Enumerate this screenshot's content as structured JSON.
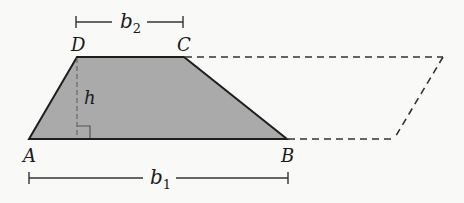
{
  "diagram": {
    "colors": {
      "fill": "#aaaaaa",
      "stroke": "#1e1e1e",
      "dashed": "#333333",
      "background": "#f9f9f8"
    },
    "vertices": {
      "A": {
        "label": "A",
        "x": 29,
        "y": 139
      },
      "B": {
        "label": "B",
        "x": 287,
        "y": 139
      },
      "C": {
        "label": "C",
        "x": 184,
        "y": 57
      },
      "D": {
        "label": "D",
        "x": 77,
        "y": 57
      }
    },
    "parallelogram_extension": {
      "top_right": {
        "x": 443,
        "y": 57
      },
      "bottom_right": {
        "x": 394,
        "y": 139
      }
    },
    "height": {
      "label": "h"
    },
    "bases": {
      "b1": {
        "var": "b",
        "sub": "1"
      },
      "b2": {
        "var": "b",
        "sub": "2"
      }
    }
  }
}
